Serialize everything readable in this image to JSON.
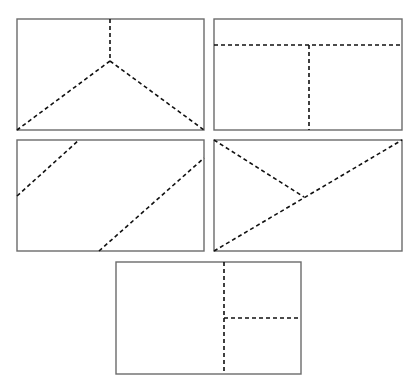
{
  "diagram": {
    "colors": {
      "background": "#ffffff",
      "frame": "#6b6b6b",
      "dashed_line": "#111111"
    },
    "panels": [
      {
        "id": "panel-1",
        "rect": {
          "x": 17,
          "y": 19,
          "w": 187,
          "h": 111
        },
        "cuts": [
          {
            "x1": 110,
            "y1": 19,
            "x2": 110,
            "y2": 61
          },
          {
            "x1": 110,
            "y1": 61,
            "x2": 17,
            "y2": 130
          },
          {
            "x1": 110,
            "y1": 61,
            "x2": 204,
            "y2": 130
          }
        ],
        "regions": 3
      },
      {
        "id": "panel-2",
        "rect": {
          "x": 214,
          "y": 19,
          "w": 188,
          "h": 111
        },
        "cuts": [
          {
            "x1": 214,
            "y1": 45,
            "x2": 402,
            "y2": 45
          },
          {
            "x1": 309,
            "y1": 45,
            "x2": 309,
            "y2": 130
          }
        ],
        "regions": 3
      },
      {
        "id": "panel-3",
        "rect": {
          "x": 17,
          "y": 140,
          "w": 187,
          "h": 111
        },
        "cuts": [
          {
            "x1": 17,
            "y1": 196,
            "x2": 79,
            "y2": 140
          },
          {
            "x1": 99,
            "y1": 251,
            "x2": 204,
            "y2": 158
          }
        ],
        "regions": 3
      },
      {
        "id": "panel-4",
        "rect": {
          "x": 214,
          "y": 140,
          "w": 188,
          "h": 111
        },
        "cuts": [
          {
            "x1": 214,
            "y1": 251,
            "x2": 402,
            "y2": 140
          },
          {
            "x1": 214,
            "y1": 140,
            "x2": 304,
            "y2": 197
          }
        ],
        "regions": 3
      },
      {
        "id": "panel-5",
        "rect": {
          "x": 116,
          "y": 262,
          "w": 185,
          "h": 112
        },
        "cuts": [
          {
            "x1": 224,
            "y1": 262,
            "x2": 224,
            "y2": 374
          },
          {
            "x1": 224,
            "y1": 318,
            "x2": 301,
            "y2": 318
          }
        ],
        "regions": 3
      }
    ]
  }
}
